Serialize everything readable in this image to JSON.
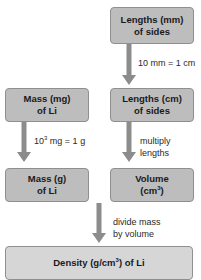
{
  "diagram": {
    "nodes": {
      "lengths_mm": {
        "line1": "Lengths (mm)",
        "line2": "of sides"
      },
      "mass_mg": {
        "line1": "Mass (mg)",
        "line2": "of Li"
      },
      "lengths_cm": {
        "line1": "Lengths (cm)",
        "line2": "of sides"
      },
      "mass_g": {
        "line1": "Mass (g)",
        "line2": "of Li"
      },
      "volume": {
        "line1": "Volume",
        "line2_base": "(cm",
        "line2_sup": "3",
        "line2_end": ")"
      },
      "density": {
        "base": "Density (g/cm",
        "sup": "3",
        "end": ") of Li"
      }
    },
    "edges": {
      "mm_to_cm": {
        "label": "10 mm = 1 cm"
      },
      "mg_to_g": {
        "label_base": "10",
        "label_sup": "3",
        "label_end": " mg = 1 g"
      },
      "cm_to_volume": {
        "line1": "multiply",
        "line2": "lengths"
      },
      "to_density": {
        "line1": "divide mass",
        "line2": "by volume"
      }
    }
  }
}
